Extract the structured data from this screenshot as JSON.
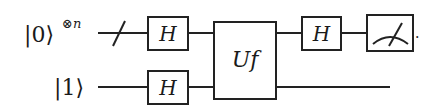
{
  "diagram": {
    "type": "quantum-circuit",
    "qubits": [
      {
        "label_ket": "|0⟩",
        "label_sup": "⊗n",
        "bundled": true
      },
      {
        "label_ket": "|1⟩",
        "label_sup": "",
        "bundled": false
      }
    ],
    "gates": [
      {
        "name": "H",
        "wire": 0
      },
      {
        "name": "H",
        "wire": 1
      },
      {
        "name": "Uf",
        "wires": [
          0,
          1
        ]
      },
      {
        "name": "H",
        "wire": 0
      },
      {
        "name": "measure",
        "wire": 0
      }
    ],
    "labels": {
      "q0_ket": "|0⟩",
      "q0_sup": "⊗n",
      "q1_ket": "|1⟩",
      "h1": "H",
      "h2": "H",
      "uf": "Uf",
      "h3": "H",
      "trailing_dot": "."
    },
    "colors": {
      "ink": "#222222",
      "background": "#ffffff"
    }
  }
}
